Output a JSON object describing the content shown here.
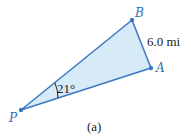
{
  "figure": {
    "caption": "(a)",
    "colors": {
      "line": "#3a78c0",
      "fill": "#d6eaf8",
      "point_label": "#2f6db0",
      "text": "#222222"
    },
    "points": [
      {
        "label": "P",
        "x": 21,
        "y": 110
      },
      {
        "label": "A",
        "x": 151,
        "y": 68
      },
      {
        "label": "B",
        "x": 132,
        "y": 20
      }
    ],
    "side_label": "6.0 mi",
    "angle_label": "21°"
  }
}
